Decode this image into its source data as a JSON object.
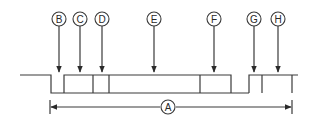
{
  "diagram": {
    "callouts": [
      {
        "id": "B",
        "label": "B"
      },
      {
        "id": "C",
        "label": "C"
      },
      {
        "id": "D",
        "label": "D"
      },
      {
        "id": "E",
        "label": "E"
      },
      {
        "id": "F",
        "label": "F"
      },
      {
        "id": "G",
        "label": "G"
      },
      {
        "id": "H",
        "label": "H"
      }
    ],
    "dimension": {
      "label": "A"
    },
    "colors": {
      "line": "#3a3a3a",
      "background": "#ffffff"
    }
  }
}
